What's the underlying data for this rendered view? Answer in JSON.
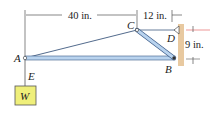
{
  "diagram": {
    "points": {
      "A": {
        "label": "A",
        "x": 25,
        "y": 58
      },
      "B": {
        "label": "B",
        "x": 174,
        "y": 59
      },
      "C": {
        "label": "C",
        "x": 137,
        "y": 31
      },
      "D": {
        "label": "D",
        "x": 176,
        "y": 31
      },
      "E": {
        "label": "E",
        "x": 25,
        "y": 78
      }
    },
    "load": {
      "label": "W",
      "fill": "#efef7a",
      "stroke": "#555"
    },
    "dimensions": {
      "horizontal_AC": "40 in.",
      "horizontal_CD": "12 in.",
      "vertical_DB": "9 in."
    },
    "colors": {
      "member": "#b9d3ee",
      "member_stroke": "#3a5a88",
      "cable": "#3f5a80",
      "wall": "#e8c9a0",
      "dim_line": "#333",
      "red_tick": "#e05050"
    }
  }
}
